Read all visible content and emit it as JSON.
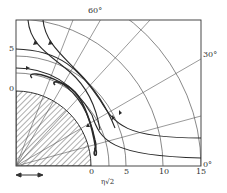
{
  "diagram": {
    "type": "flow-lines-around-cylinder-polar-grid",
    "x_axis_label": "η√2",
    "x_ticks": [
      "0",
      "5",
      "10",
      "15"
    ],
    "y_ticks": [
      "0",
      "5"
    ],
    "angle_labels": [
      "60°",
      "30°",
      "0°"
    ],
    "scale_arrow": "↔",
    "colors": {
      "line": "#2a2a2a",
      "grid": "#555555",
      "background": "#ffffff"
    }
  }
}
